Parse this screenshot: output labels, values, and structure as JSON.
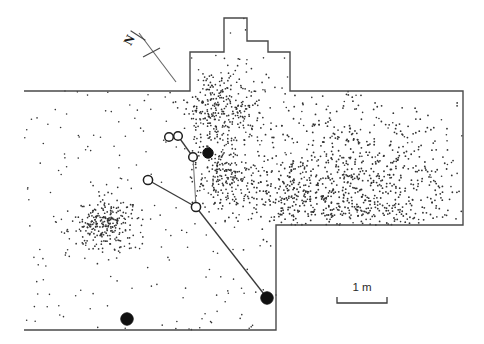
{
  "figure": {
    "kind": "archaeological-site-plan",
    "background_color": "#ffffff",
    "width": 484,
    "height": 344
  },
  "north_arrow": {
    "label": "N",
    "label_x": 133,
    "label_y": 42,
    "label_rotation": -62,
    "shaft": {
      "x1": 139,
      "y1": 33,
      "x2": 176,
      "y2": 82
    },
    "crossbar": {
      "x1": 143,
      "y1": 57,
      "x2": 160,
      "y2": 48
    },
    "head": {
      "x1": 131,
      "y1": 31,
      "x2": 145,
      "y2": 40
    },
    "color": "#4a4a4a"
  },
  "scale_bar": {
    "label": "1 m",
    "label_x": 362,
    "label_y": 291,
    "bar": {
      "x1": 337,
      "y1": 303,
      "x2": 387,
      "y2": 303
    },
    "tick_height": 6,
    "length_px": 50,
    "length_value": 1,
    "length_unit": "m",
    "color": "#3a3a3a"
  },
  "excavation_outline": {
    "stroke_color": "#4a4a4a",
    "stroke_width": 1.4,
    "points": "24,91 190,91 190,52 224,52 224,18 247,18 247,41 268,41 268,52 290,52 290,91 463,91 463,225 276,225 276,330 24,330"
  },
  "refit_network": {
    "line_color": "#3a3a3a",
    "nodes": [
      {
        "id": "n1",
        "type": "open",
        "cx": 169,
        "cy": 137,
        "r": 4.3
      },
      {
        "id": "n2",
        "type": "open",
        "cx": 178,
        "cy": 136,
        "r": 4.3
      },
      {
        "id": "n3",
        "type": "open",
        "cx": 193,
        "cy": 157,
        "r": 4.3
      },
      {
        "id": "n4",
        "type": "filled",
        "cx": 208,
        "cy": 153,
        "r": 5.2
      },
      {
        "id": "n5",
        "type": "open",
        "cx": 148,
        "cy": 180,
        "r": 4.6
      },
      {
        "id": "n6",
        "type": "open",
        "cx": 196,
        "cy": 207,
        "r": 4.6
      },
      {
        "id": "n7",
        "type": "filled",
        "cx": 267,
        "cy": 298,
        "r": 6.2
      },
      {
        "id": "n8",
        "type": "filled",
        "cx": 127,
        "cy": 319,
        "r": 6.2
      }
    ],
    "links": [
      {
        "from": "n1",
        "to": "n2",
        "weight": "bold"
      },
      {
        "from": "n2",
        "to": "n3",
        "weight": "bold"
      },
      {
        "from": "n3",
        "to": "n6",
        "weight": "thin"
      },
      {
        "from": "n5",
        "to": "n6",
        "weight": "bold"
      },
      {
        "from": "n6",
        "to": "n7",
        "weight": "bold"
      }
    ]
  },
  "artifact_scatter": {
    "dot_color": "#333333",
    "description": "piece-plotted lithic debitage",
    "clusters": [
      {
        "name": "north-alcove-dense",
        "cx": 222,
        "cy": 110,
        "rx": 36,
        "ry": 42,
        "count": 330,
        "dot_radius": 0.85
      },
      {
        "name": "central-upper-dense",
        "cx": 224,
        "cy": 178,
        "rx": 26,
        "ry": 30,
        "count": 200,
        "dot_radius": 0.85
      },
      {
        "name": "southwest-dense",
        "cx": 106,
        "cy": 225,
        "rx": 30,
        "ry": 25,
        "count": 260,
        "dot_radius": 0.85
      },
      {
        "name": "east-broad-medium",
        "cx": 360,
        "cy": 165,
        "rx": 95,
        "ry": 68,
        "count": 520,
        "dot_radius": 0.9
      },
      {
        "name": "east-lower-medium",
        "cx": 370,
        "cy": 205,
        "rx": 88,
        "ry": 25,
        "count": 210,
        "dot_radius": 0.9
      },
      {
        "name": "central-band-medium",
        "cx": 290,
        "cy": 195,
        "rx": 55,
        "ry": 35,
        "count": 180,
        "dot_radius": 0.9
      }
    ],
    "background_count": 300,
    "background_dot_radius": 0.8
  }
}
